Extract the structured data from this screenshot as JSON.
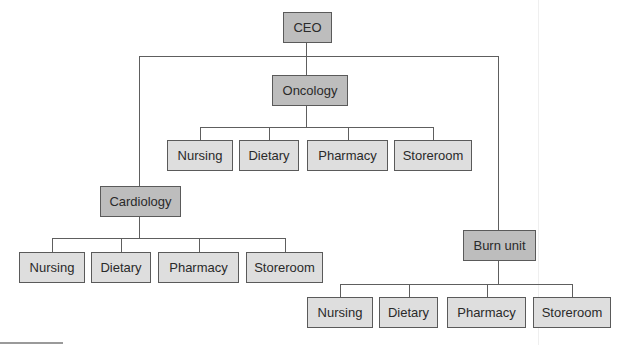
{
  "root": {
    "label": "CEO",
    "children": [
      {
        "label": "Oncology",
        "children": [
          "Nursing",
          "Dietary",
          "Pharmacy",
          "Storeroom"
        ]
      },
      {
        "label": "Cardiology",
        "children": [
          "Nursing",
          "Dietary",
          "Pharmacy",
          "Storeroom"
        ]
      },
      {
        "label": "Burn unit",
        "children": [
          "Nursing",
          "Dietary",
          "Pharmacy",
          "Storeroom"
        ]
      }
    ]
  },
  "colors": {
    "executive_fill": "#bdbdbd",
    "department_fill": "#bdbdbd",
    "function_fill": "#dedede",
    "line": "#5e5e5e",
    "border": "#5a5a5a"
  }
}
